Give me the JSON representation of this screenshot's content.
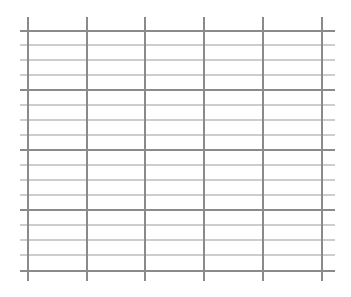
{
  "grid": {
    "width": 351,
    "height": 297,
    "background": "#ffffff",
    "horizontal": {
      "x_start": 20,
      "x_end": 335,
      "positions": [
        31,
        45,
        60,
        75,
        90,
        105,
        120,
        135,
        150,
        165,
        180,
        195,
        210,
        225,
        240,
        255,
        271
      ],
      "major_every": 4,
      "major_color": "#8a8a8a",
      "major_width": 2,
      "minor_color": "#bdbdbd",
      "minor_width": 1.3
    },
    "vertical": {
      "y_start": 17,
      "y_end": 281,
      "positions": [
        28,
        87,
        145,
        204,
        263,
        322
      ],
      "color": "#8a8a8a",
      "width": 2
    }
  }
}
